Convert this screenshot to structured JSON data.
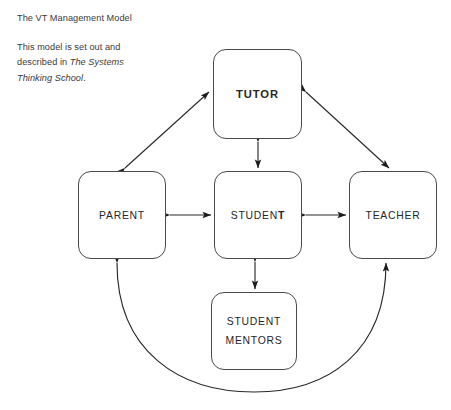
{
  "caption": {
    "title": "The VT Management Model",
    "body_before": "This model is set out and described in ",
    "body_book": "The Systems Thinking School",
    "body_after": "."
  },
  "nodes": {
    "tutor": {
      "label": "TUTOR"
    },
    "parent": {
      "label": "PARENT"
    },
    "student": {
      "label_head": "STUDEN",
      "label_tail": "T"
    },
    "teacher": {
      "label": "TEACHER"
    },
    "mentors": {
      "label_line1": "STUDENT",
      "label_line2": "MENTORS"
    }
  },
  "diagram_data": {
    "type": "diagram",
    "title": "The VT Management Model",
    "node_count": 5,
    "nodes": [
      {
        "id": "tutor",
        "label": "TUTOR",
        "emphasis": "bold",
        "x": 257,
        "y": 94
      },
      {
        "id": "parent",
        "label": "PARENT",
        "emphasis": "normal",
        "x": 122,
        "y": 215
      },
      {
        "id": "student",
        "label": "STUDENT",
        "emphasis": "normal",
        "x": 258,
        "y": 215
      },
      {
        "id": "teacher",
        "label": "TEACHER",
        "emphasis": "normal",
        "x": 393,
        "y": 215
      },
      {
        "id": "student_mentors",
        "label": "STUDENT MENTORS",
        "emphasis": "normal",
        "x": 254,
        "y": 331
      }
    ],
    "edges": [
      {
        "from": "parent",
        "to": "tutor",
        "arrow": "double",
        "style": "straight"
      },
      {
        "from": "tutor",
        "to": "teacher",
        "arrow": "double",
        "style": "straight"
      },
      {
        "from": "tutor",
        "to": "student",
        "arrow": "double",
        "style": "straight"
      },
      {
        "from": "parent",
        "to": "student",
        "arrow": "double",
        "style": "straight"
      },
      {
        "from": "student",
        "to": "teacher",
        "arrow": "double",
        "style": "straight"
      },
      {
        "from": "student",
        "to": "student_mentors",
        "arrow": "double",
        "style": "straight"
      },
      {
        "from": "parent",
        "to": "teacher",
        "arrow": "double",
        "style": "curved-arc-below"
      }
    ],
    "colors": {
      "stroke": "#4a4a4a",
      "text": "#262626",
      "background": "#ffffff"
    }
  }
}
